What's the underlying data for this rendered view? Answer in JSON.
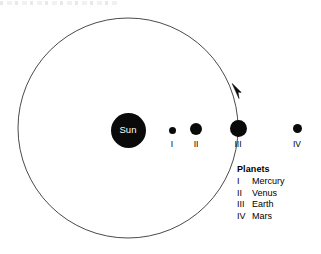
{
  "diagram": {
    "background_color": "#ffffff",
    "ink_color": "#000000",
    "orbit_stroke_color": "#4a4a4a"
  },
  "sun": {
    "label": "Sun",
    "label_color": "#ffffff",
    "fill": "#0a0a0a",
    "center_x": 128,
    "center_y": 130,
    "diameter": 35
  },
  "orbit": {
    "center_x": 128,
    "center_y": 128,
    "radius": 110,
    "stroke_width": 1,
    "arrow_direction": "counterclockwise",
    "arrow_tip_x": 233,
    "arrow_tip_y": 84
  },
  "planets": [
    {
      "numeral": "I",
      "name": "Mercury",
      "center_x": 172,
      "center_y": 130,
      "diameter": 7,
      "fill": "#0a0a0a"
    },
    {
      "numeral": "II",
      "name": "Venus",
      "center_x": 196,
      "center_y": 129,
      "diameter": 12,
      "fill": "#0a0a0a"
    },
    {
      "numeral": "III",
      "name": "Earth",
      "center_x": 238,
      "center_y": 128,
      "diameter": 17,
      "fill": "#0a0a0a"
    },
    {
      "numeral": "IV",
      "name": "Mars",
      "center_x": 297,
      "center_y": 128,
      "diameter": 9,
      "fill": "#0a0a0a"
    }
  ],
  "legend": {
    "title": "Planets",
    "entries": [
      {
        "numeral": "I",
        "name": "Mercury"
      },
      {
        "numeral": "II",
        "name": "Venus"
      },
      {
        "numeral": "III",
        "name": "Earth"
      },
      {
        "numeral": "IV",
        "name": "Mars"
      }
    ]
  }
}
